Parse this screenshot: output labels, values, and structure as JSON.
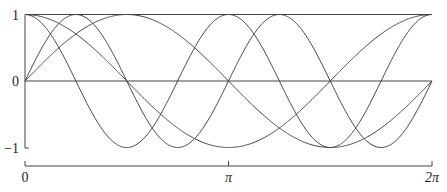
{
  "chart_data": {
    "type": "line",
    "title": "",
    "xlabel": "",
    "ylabel": "",
    "xlim": [
      0,
      6.2832
    ],
    "ylim": [
      -1,
      1
    ],
    "grid": false,
    "legend": null,
    "x_ticks": [
      {
        "value": 0,
        "label": "0"
      },
      {
        "value": 3.1416,
        "label": "π"
      },
      {
        "value": 6.2832,
        "label": "2π"
      }
    ],
    "y_ticks": [
      {
        "value": 1,
        "label": "1"
      },
      {
        "value": 0,
        "label": "0"
      },
      {
        "value": -1,
        "label": "−1"
      }
    ],
    "reference_lines": [
      {
        "orientation": "horizontal",
        "y": 1
      },
      {
        "orientation": "horizontal",
        "y": 0
      }
    ],
    "series": [
      {
        "name": "cos x",
        "fn": "cos",
        "k": 1
      },
      {
        "name": "sin x",
        "fn": "sin",
        "k": 1
      },
      {
        "name": "cos 2x",
        "fn": "cos",
        "k": 2
      },
      {
        "name": "sin 2x",
        "fn": "sin",
        "k": 2
      }
    ],
    "line_color": "#444444"
  }
}
